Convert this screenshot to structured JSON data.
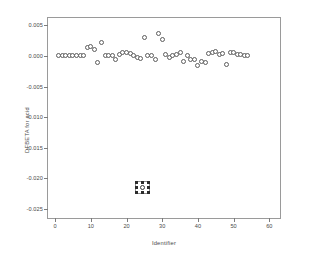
{
  "chart_data": {
    "type": "scatter",
    "title": "",
    "xlabel": "Identifier",
    "ylabel": "DFBETA for acid",
    "xlim": [
      -2,
      63
    ],
    "ylim": [
      -0.0265,
      0.0062
    ],
    "xticks": [
      0,
      10,
      20,
      30,
      40,
      50,
      60
    ],
    "xtick_labels": [
      "0",
      "10",
      "20",
      "30",
      "40",
      "50",
      "60"
    ],
    "yticks": [
      0.005,
      0.0,
      -0.005,
      -0.01,
      -0.015,
      -0.02,
      -0.025
    ],
    "ytick_labels": [
      "0.005",
      "0.000",
      "-0.005",
      "-0.010",
      "-0.015",
      "-0.020",
      "-0.025"
    ],
    "grid": false,
    "legend": false,
    "marker": "open-circle",
    "marker_color": "#5d5d5d",
    "frame_color": "#9a9a9a",
    "series": [
      {
        "name": "DFBETA for acid",
        "points": [
          {
            "x": 1,
            "y": 5e-05
          },
          {
            "x": 2,
            "y": 5e-05
          },
          {
            "x": 3,
            "y": 2e-05
          },
          {
            "x": 4,
            "y": 5e-05
          },
          {
            "x": 5,
            "y": 8e-05
          },
          {
            "x": 6,
            "y": 0.0001
          },
          {
            "x": 7,
            "y": 0.00012
          },
          {
            "x": 8,
            "y": 0.0001
          },
          {
            "x": 9,
            "y": 0.0013
          },
          {
            "x": 10,
            "y": 0.00155
          },
          {
            "x": 11,
            "y": 0.001
          },
          {
            "x": 12,
            "y": -0.00105
          },
          {
            "x": 13,
            "y": 0.0022
          },
          {
            "x": 14,
            "y": 0.0001
          },
          {
            "x": 15,
            "y": 5e-05
          },
          {
            "x": 16,
            "y": 0.0
          },
          {
            "x": 17,
            "y": -0.00065
          },
          {
            "x": 18,
            "y": 0.0003
          },
          {
            "x": 19,
            "y": 0.0005
          },
          {
            "x": 20,
            "y": 0.00055
          },
          {
            "x": 21,
            "y": 0.00035
          },
          {
            "x": 22,
            "y": 0.0001
          },
          {
            "x": 23,
            "y": -0.0002
          },
          {
            "x": 24,
            "y": -0.00045
          },
          {
            "x": 25,
            "y": 0.003
          },
          {
            "x": 26,
            "y": 5e-05
          },
          {
            "x": 27,
            "y": 0.0001
          },
          {
            "x": 28,
            "y": -0.00055
          },
          {
            "x": 29,
            "y": 0.0037
          },
          {
            "x": 30,
            "y": 0.00275
          },
          {
            "x": 31,
            "y": 0.00025
          },
          {
            "x": 32,
            "y": -0.0002
          },
          {
            "x": 33,
            "y": 0.0001
          },
          {
            "x": 34,
            "y": 0.00025
          },
          {
            "x": 35,
            "y": 0.0006
          },
          {
            "x": 36,
            "y": -0.0009
          },
          {
            "x": 37,
            "y": 0.00015
          },
          {
            "x": 38,
            "y": -0.0006
          },
          {
            "x": 39,
            "y": -0.00055
          },
          {
            "x": 40,
            "y": -0.00155
          },
          {
            "x": 41,
            "y": -0.00095
          },
          {
            "x": 42,
            "y": -0.00105
          },
          {
            "x": 43,
            "y": 0.0004
          },
          {
            "x": 44,
            "y": 0.0005
          },
          {
            "x": 45,
            "y": 0.0008
          },
          {
            "x": 46,
            "y": 0.0003
          },
          {
            "x": 47,
            "y": 0.00035
          },
          {
            "x": 48,
            "y": -0.00145
          },
          {
            "x": 49,
            "y": 0.00055
          },
          {
            "x": 50,
            "y": 0.0005
          },
          {
            "x": 51,
            "y": 0.00025
          },
          {
            "x": 52,
            "y": 0.0002
          },
          {
            "x": 53,
            "y": 0.00015
          },
          {
            "x": 54,
            "y": 0.00012
          },
          {
            "x": 24.5,
            "y": -0.0215,
            "selected": true
          }
        ]
      }
    ],
    "annotations": [
      {
        "kind": "selection-box",
        "x": 24.5,
        "y": -0.0215,
        "note": "selected outlier marker with drag handles"
      }
    ]
  }
}
